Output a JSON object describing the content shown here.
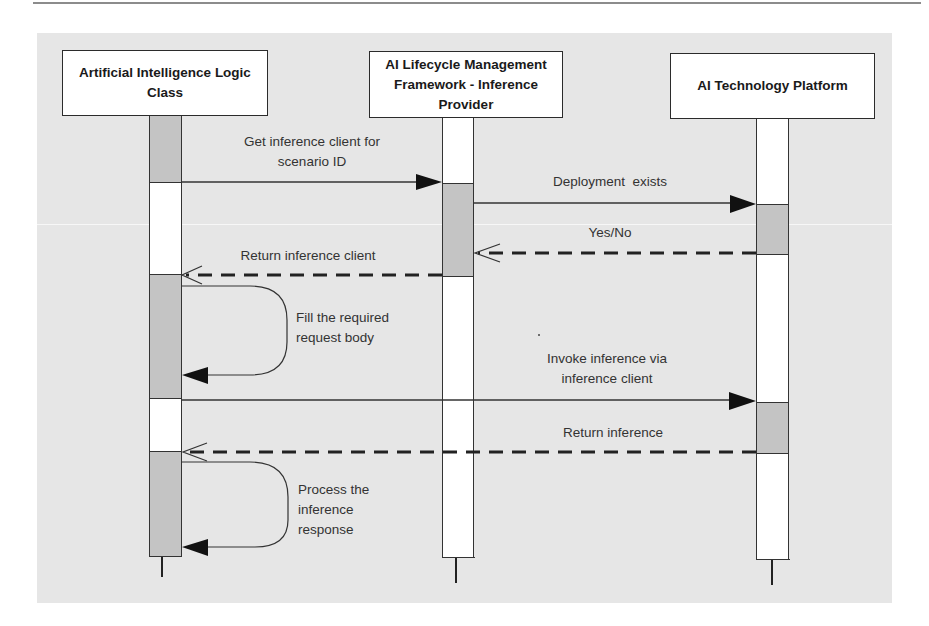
{
  "diagram": {
    "type": "sequence-diagram",
    "participants": [
      {
        "id": "logic",
        "label": "Artificial Intelligence Logic Class"
      },
      {
        "id": "provider",
        "label": "AI Lifecycle Management Framework - Inference Provider"
      },
      {
        "id": "platform",
        "label": "AI Technology Platform"
      }
    ],
    "messages": [
      {
        "from": "logic",
        "to": "provider",
        "style": "solid",
        "label_line1": "Get inference client for",
        "label_line2": "scenario ID"
      },
      {
        "from": "provider",
        "to": "platform",
        "style": "solid",
        "label": "Deployment  exists"
      },
      {
        "from": "platform",
        "to": "provider",
        "style": "dashed-return",
        "label": "Yes/No"
      },
      {
        "from": "provider",
        "to": "logic",
        "style": "dashed-return",
        "label": "Return inference client"
      },
      {
        "from": "logic",
        "to": "logic",
        "style": "self-call",
        "label_line1": "Fill the required",
        "label_line2": "request body"
      },
      {
        "from": "logic",
        "to": "platform",
        "style": "solid",
        "label_line1": "Invoke inference via",
        "label_line2": "inference client"
      },
      {
        "from": "platform",
        "to": "logic",
        "style": "dashed-return",
        "label": "Return inference"
      },
      {
        "from": "logic",
        "to": "logic",
        "style": "self-call",
        "label_line1": "Process the",
        "label_line2": "inference",
        "label_line3": "response"
      }
    ],
    "colors": {
      "canvas": "#e6e6e6",
      "activation": "#c4c4c4",
      "lifeline": "#ffffff",
      "stroke": "#2b2b2b",
      "text": "#333333"
    }
  }
}
